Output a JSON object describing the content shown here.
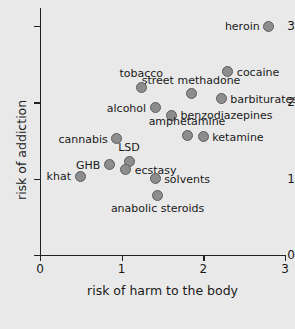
{
  "chart_data": {
    "type": "scatter",
    "title": "",
    "xlabel": "risk of harm to the body",
    "ylabel": "risk of addiction",
    "xlim": [
      0,
      3
    ],
    "ylim": [
      0,
      3
    ],
    "xticks": [
      0,
      1,
      2,
      3
    ],
    "yticks": [
      0,
      1,
      2,
      3
    ],
    "xtick_labels": [
      "0",
      "1",
      "2",
      "3"
    ],
    "ytick_labels": [
      "0",
      "1",
      "2",
      "3"
    ],
    "grid": false,
    "legend": false,
    "marker_color": "#8d8d8d",
    "marker_edge_color": "#5d5d5d",
    "background_color": "#e9e9e9",
    "axis_color": "#222222",
    "points": [
      {
        "label": "heroin",
        "x": 2.8,
        "y": 3.0,
        "label_pos": "left"
      },
      {
        "label": "cocaine",
        "x": 2.3,
        "y": 2.4,
        "label_pos": "right"
      },
      {
        "label": "barbiturates",
        "x": 2.22,
        "y": 2.05,
        "label_pos": "right"
      },
      {
        "label": "street methadone",
        "x": 1.85,
        "y": 2.11,
        "label_pos": "above"
      },
      {
        "label": "tobacco",
        "x": 1.24,
        "y": 2.2,
        "label_pos": "above"
      },
      {
        "label": "alcohol",
        "x": 1.41,
        "y": 1.93,
        "label_pos": "left"
      },
      {
        "label": "benzodiazepines",
        "x": 1.61,
        "y": 1.83,
        "label_pos": "right"
      },
      {
        "label": "amphetamine",
        "x": 1.8,
        "y": 1.57,
        "label_pos": "above"
      },
      {
        "label": "ketamine",
        "x": 2.0,
        "y": 1.55,
        "label_pos": "right"
      },
      {
        "label": "cannabis",
        "x": 0.94,
        "y": 1.52,
        "label_pos": "left"
      },
      {
        "label": "LSD",
        "x": 1.09,
        "y": 1.23,
        "label_pos": "above"
      },
      {
        "label": "GHB",
        "x": 0.85,
        "y": 1.18,
        "label_pos": "left"
      },
      {
        "label": "ecstasy",
        "x": 1.05,
        "y": 1.12,
        "label_pos": "right"
      },
      {
        "label": "khat",
        "x": 0.49,
        "y": 1.03,
        "label_pos": "left"
      },
      {
        "label": "solvents",
        "x": 1.41,
        "y": 1.0,
        "label_pos": "right"
      },
      {
        "label": "anabolic steroids",
        "x": 1.44,
        "y": 0.78,
        "label_pos": "below"
      }
    ]
  }
}
